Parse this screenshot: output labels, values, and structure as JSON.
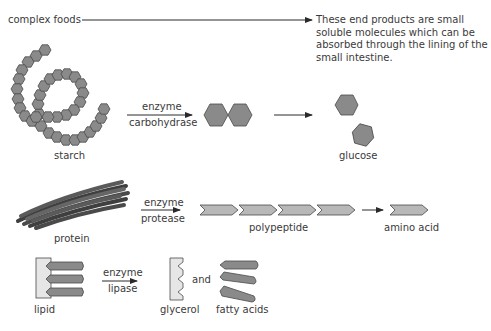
{
  "header": {
    "complex_foods_label": "complex foods",
    "end_products_note": "These end products are small soluble molecules which can be absorbed through the lining of the small intestine."
  },
  "rows": [
    {
      "name": "carbohydrate",
      "substrate_label": "starch",
      "enzyme_top": "enzyme",
      "enzyme_bottom": "carbohydrase",
      "product_label": "glucose"
    },
    {
      "name": "protein",
      "substrate_label": "protein",
      "enzyme_top": "enzyme",
      "enzyme_bottom": "protease",
      "intermediate_label": "polypeptide",
      "product_label": "amino acid"
    },
    {
      "name": "lipid",
      "substrate_label": "lipid",
      "enzyme_top": "enzyme",
      "enzyme_bottom": "lipase",
      "product_label": "glycerol",
      "conjunction": "and",
      "product2_label": "fatty acids"
    }
  ],
  "colors": {
    "molecule_fill": "#8a8a8a",
    "molecule_stroke": "#4a4a4a",
    "chain_fill": "#b8b8b8",
    "glycerol_fill": "#e6e6e6",
    "text": "#3a3a3a"
  }
}
